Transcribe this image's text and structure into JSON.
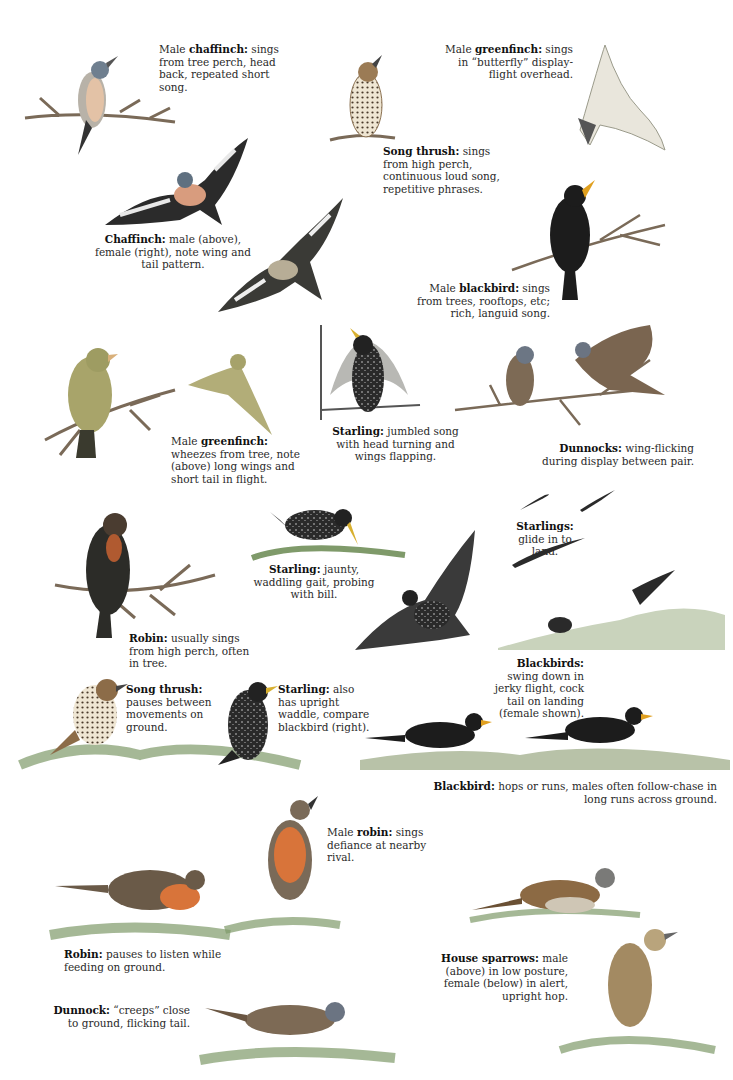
{
  "captions": [
    {
      "id": "chaffinch-male-sing",
      "lead": "Male ",
      "bold": "chaffinch:",
      "text": " sings from tree perch, head back, repeated short song."
    },
    {
      "id": "greenfinch-display",
      "lead": "Male ",
      "bold": "greenfinch:",
      "text": " sings in “butterfly” display-flight overhead."
    },
    {
      "id": "song-thrush-sing",
      "lead": "",
      "bold": "Song thrush:",
      "text": " sings from high perch, continuous loud song, repetitive phrases."
    },
    {
      "id": "chaffinch-flight",
      "lead": "",
      "bold": "Chaffinch:",
      "text": " male (above), female (right), note wing and tail pattern."
    },
    {
      "id": "blackbird-sing",
      "lead": "Male ",
      "bold": "blackbird:",
      "text": " sings from trees, rooftops, etc; rich, languid song."
    },
    {
      "id": "greenfinch-wheeze",
      "lead": "Male ",
      "bold": "greenfinch:",
      "text": " wheezes from tree, note (above) long wings and short tail in flight."
    },
    {
      "id": "starling-sing",
      "lead": "",
      "bold": "Starling:",
      "text": " jumbled song with head turning and wings flapping."
    },
    {
      "id": "dunnocks-display",
      "lead": "",
      "bold": "Dunnocks:",
      "text": " wing-flicking during display between pair."
    },
    {
      "id": "starlings-glide",
      "lead": "",
      "bold": "Starlings:",
      "text": " glide in to land."
    },
    {
      "id": "starling-gait",
      "lead": "",
      "bold": "Starling:",
      "text": " jaunty, waddling gait, probing with bill."
    },
    {
      "id": "robin-sing",
      "lead": "",
      "bold": "Robin:",
      "text": " usually sings from high perch, often in tree."
    },
    {
      "id": "blackbirds-swing",
      "lead": "",
      "bold": "Blackbirds:",
      "text": " swing down in jerky flight, cock tail on landing (female shown)."
    },
    {
      "id": "song-thrush-ground",
      "lead": "",
      "bold": "Song thrush:",
      "text": " pauses between movements on ground."
    },
    {
      "id": "starling-upright",
      "lead": "",
      "bold": "Starling:",
      "text": " also has upright waddle, compare blackbird (right)."
    },
    {
      "id": "blackbird-hops",
      "lead": "",
      "bold": "Blackbird:",
      "text": " hops or runs, males often follow-chase in long runs across ground."
    },
    {
      "id": "robin-defiance",
      "lead": "Male ",
      "bold": "robin:",
      "text": " sings defiance at nearby rival."
    },
    {
      "id": "robin-listen",
      "lead": "",
      "bold": "Robin:",
      "text": " pauses to listen while feeding on ground."
    },
    {
      "id": "house-sparrows",
      "lead": "",
      "bold": "House sparrows:",
      "text": " male (above) in low posture, female (below) in alert, upright hop."
    },
    {
      "id": "dunnock-creeps",
      "lead": "",
      "bold": "Dunnock:",
      "text": " “creeps” close to ground, flicking tail."
    }
  ],
  "colors": {
    "ink": "#1a1a1a",
    "branch": "#7a6a58",
    "grass": "#7f9a6a",
    "robin_breast": "#d8743a",
    "greenfinch": "#a8a46a",
    "thrush": "#9b7b55",
    "sparrow": "#8c6a44"
  }
}
